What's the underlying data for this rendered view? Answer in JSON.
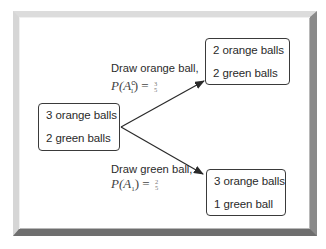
{
  "diagram": {
    "type": "probability-tree",
    "root": {
      "lines": [
        "3 orange balls",
        "2 green balls"
      ]
    },
    "branches": [
      {
        "label": "Draw orange ball,",
        "probability": {
          "prefix": "P(A",
          "superscript": "c",
          "subscript": "1",
          "suffix": ") =",
          "numerator": "3",
          "denominator": "5"
        },
        "result": {
          "lines": [
            "2 orange balls",
            "2 green balls"
          ]
        }
      },
      {
        "label": "Draw green ball,",
        "probability": {
          "prefix": "P(A",
          "superscript": "",
          "subscript": "1",
          "suffix": ") =",
          "numerator": "2",
          "denominator": "5"
        },
        "result": {
          "lines": [
            "3 orange balls",
            "1 green ball"
          ]
        }
      }
    ]
  },
  "colors": {
    "stroke": "#2a2a2a",
    "text": "#2a2a2a",
    "frame_light": "#dcdcdc",
    "frame_dark": "#6e6e6e",
    "background": "#ffffff"
  }
}
